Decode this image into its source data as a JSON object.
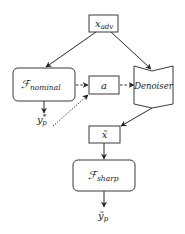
{
  "diagram": {
    "nodes": {
      "x_adv": {
        "main": "x",
        "sub": "adv"
      },
      "f_nominal": {
        "main": "ℱ",
        "sub": "nominal"
      },
      "a": {
        "main": "a"
      },
      "denoiser": {
        "main": "Denoiser"
      },
      "x_tilde": {
        "main": "x̃"
      },
      "f_sharp": {
        "main": "ℱ",
        "sub": "sharp"
      },
      "y_star": {
        "main": "y",
        "sub": "p",
        "sup": "*"
      },
      "y_tilde": {
        "main": "ỹ",
        "sub": "p"
      }
    },
    "edges": [
      {
        "from": "x_adv",
        "to": "f_nominal",
        "style": "solid"
      },
      {
        "from": "x_adv",
        "to": "denoiser",
        "style": "solid"
      },
      {
        "from": "f_nominal",
        "to": "a",
        "style": "dashed"
      },
      {
        "from": "a",
        "to": "denoiser",
        "style": "dashed"
      },
      {
        "from": "y_star",
        "to": "a",
        "style": "dotted"
      },
      {
        "from": "f_nominal",
        "to": "y_star",
        "style": "solid"
      },
      {
        "from": "denoiser",
        "to": "x_tilde",
        "style": "solid"
      },
      {
        "from": "x_tilde",
        "to": "f_sharp",
        "style": "solid"
      },
      {
        "from": "f_sharp",
        "to": "y_tilde",
        "style": "solid"
      }
    ]
  }
}
